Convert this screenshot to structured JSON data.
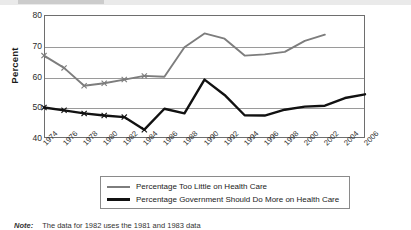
{
  "chart_data": {
    "type": "line",
    "title": "",
    "xlabel": "",
    "ylabel": "Percent",
    "ylim": [
      40,
      80
    ],
    "yticks": [
      40,
      50,
      60,
      70,
      80
    ],
    "grid": true,
    "legend_position": "bottom",
    "categories": [
      "1974",
      "1976",
      "1978",
      "1980",
      "1982",
      "1984",
      "1986",
      "1988",
      "1990",
      "1992",
      "1994",
      "1996",
      "1998",
      "2000",
      "2002",
      "2004",
      "2006"
    ],
    "series": [
      {
        "name": "Percentage Too Little on Health Care",
        "color": "#7d7d7d",
        "marker": "x",
        "values": [
          66.8,
          62.8,
          57.0,
          57.8,
          59.0,
          60.2,
          59.9,
          69.5,
          74.0,
          72.3,
          66.8,
          67.2,
          68.0,
          71.6,
          73.6,
          null,
          null
        ]
      },
      {
        "name": "Percentage Government Should Do More on Health Care",
        "color": "#111111",
        "marker": "x",
        "values": [
          49.9,
          49.0,
          48.0,
          47.3,
          46.8,
          42.7,
          49.5,
          48.0,
          59.0,
          54.0,
          47.4,
          47.3,
          49.2,
          50.2,
          50.5,
          53.0,
          54.2
        ]
      }
    ]
  },
  "axis": {
    "y_title": "Percent"
  },
  "legend": {
    "items": [
      {
        "label": "Percentage Too Little on Health Care"
      },
      {
        "label": "Percentage Government Should Do More on Health Care"
      }
    ]
  },
  "footnote": {
    "label": "Note:",
    "text": "The data for 1982 uses the 1981 and 1983 data"
  },
  "colors": {
    "series_gray": "#7d7d7d",
    "series_black": "#111111",
    "grid": "#9a9a9a",
    "frame": "#6e6e6e"
  }
}
